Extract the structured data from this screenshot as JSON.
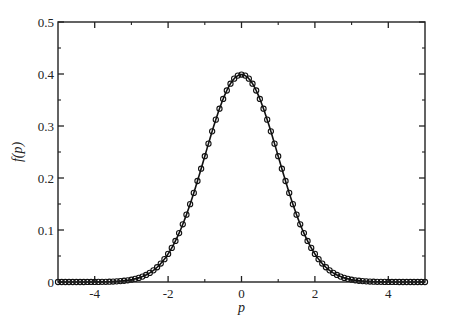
{
  "chart_data": {
    "type": "line",
    "title": "",
    "xlabel": "p",
    "ylabel": "f(p)",
    "xlim": [
      -5,
      5
    ],
    "ylim": [
      0,
      0.5
    ],
    "x_ticks": [
      -4,
      -2,
      0,
      2,
      4
    ],
    "x_minor_ticks": [
      -3,
      -1,
      1,
      3
    ],
    "y_ticks": [
      0,
      0.1,
      0.2,
      0.3,
      0.4,
      0.5
    ],
    "y_tick_labels": [
      "0",
      "0.1",
      "0.2",
      "0.3",
      "0.4",
      "0.5"
    ],
    "y_minor_ticks": [
      0.05,
      0.15,
      0.25,
      0.35,
      0.45
    ],
    "grid": false,
    "legend": null,
    "series": [
      {
        "name": "analytic",
        "style": "solid line",
        "function": "standard normal density exp(-p^2/2)/sqrt(2*pi)",
        "x": [
          -5,
          -4,
          -3,
          -2.5,
          -2,
          -1.5,
          -1,
          -0.5,
          0,
          0.5,
          1,
          1.5,
          2,
          2.5,
          3,
          4,
          5
        ],
        "values": [
          0.0,
          0.0001,
          0.0044,
          0.0175,
          0.054,
          0.1295,
          0.242,
          0.3521,
          0.3989,
          0.3521,
          0.242,
          0.1295,
          0.054,
          0.0175,
          0.0044,
          0.0001,
          0.0
        ]
      },
      {
        "name": "simulated",
        "style": "open circle markers",
        "marker_step": 0.1,
        "x_range": [
          -5,
          5
        ],
        "function": "standard normal density (markers lie on the curve)"
      }
    ],
    "colors": {
      "line": "#111111",
      "marker": "#111111",
      "axis": "#222222",
      "background": "#ffffff"
    }
  }
}
